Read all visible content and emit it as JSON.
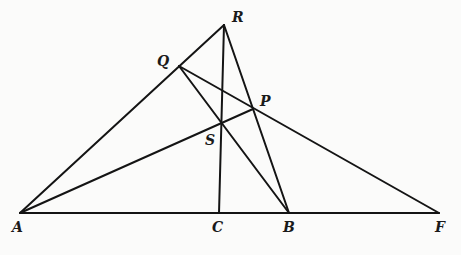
{
  "diagram": {
    "points": {
      "A": {
        "label": "A",
        "x": 20,
        "y": 213,
        "lx": 12,
        "ly": 232
      },
      "C": {
        "label": "C",
        "x": 219,
        "y": 213,
        "lx": 212,
        "ly": 232
      },
      "B": {
        "label": "B",
        "x": 289,
        "y": 213,
        "lx": 283,
        "ly": 232
      },
      "F": {
        "label": "F",
        "x": 439,
        "y": 213,
        "lx": 435,
        "ly": 232
      },
      "R": {
        "label": "R",
        "x": 224,
        "y": 25,
        "lx": 232,
        "ly": 22
      },
      "Q": {
        "label": "Q",
        "x": 179,
        "y": 66,
        "lx": 157,
        "ly": 66
      },
      "P": {
        "label": "P",
        "x": 253,
        "y": 109,
        "lx": 260,
        "ly": 106
      },
      "S": {
        "label": "S",
        "x": 221,
        "y": 122,
        "lx": 205,
        "ly": 145
      }
    },
    "segments": [
      {
        "name": "segment-AF",
        "from": "A",
        "to": "F"
      },
      {
        "name": "segment-AR",
        "from": "A",
        "to": "R"
      },
      {
        "name": "segment-AP",
        "from": "A",
        "to": "P"
      },
      {
        "name": "segment-RC",
        "from": "R",
        "to": "C"
      },
      {
        "name": "segment-RB",
        "from": "R",
        "to": "B"
      },
      {
        "name": "segment-QB",
        "from": "Q",
        "to": "B"
      },
      {
        "name": "segment-QF",
        "from": "Q",
        "to": "F"
      }
    ]
  }
}
